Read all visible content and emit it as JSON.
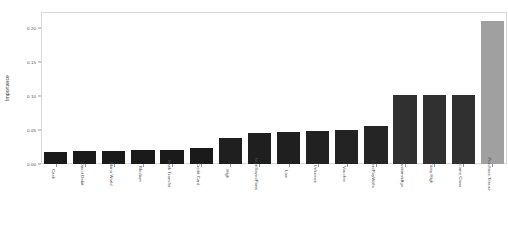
{
  "chart_data": {
    "type": "bar",
    "title": "",
    "subtitle": "",
    "xlabel": "",
    "ylabel": "Importance",
    "ylim": [
      0,
      0.2234
    ],
    "grid": false,
    "legend": null,
    "orientation": "vertical",
    "sorted": "ascending",
    "categories": [
      "Cash",
      "Direct Debit",
      "Mono World",
      "Medium",
      "Bank Transfer",
      "Credit Card",
      "High",
      "NumSavedParts",
      "Low",
      "Unknown",
      "Voucher",
      "CardPayWalls",
      "CustomerAge",
      "Very High",
      "Income Class",
      "Purchase Tenure"
    ],
    "values": [
      0.018,
      0.019,
      0.019,
      0.02,
      0.02,
      0.024,
      0.038,
      0.046,
      0.047,
      0.048,
      0.05,
      0.056,
      0.102,
      0.102,
      0.102,
      0.21
    ],
    "ytick_labels": [
      "0.00",
      "0.05",
      "0.10",
      "0.15",
      "0.20"
    ],
    "ytick_values": [
      0.0,
      0.05,
      0.1,
      0.15,
      0.2
    ],
    "bar_colors": [
      "#1a1a1a",
      "#1a1a1a",
      "#1a1a1a",
      "#1a1a1a",
      "#1a1a1a",
      "#1a1a1a",
      "#1f1f1f",
      "#1f1f1f",
      "#1f1f1f",
      "#212121",
      "#232323",
      "#252525",
      "#303030",
      "#303030",
      "#303030",
      "#a0a0a0"
    ],
    "highlight_color": "#a0a0a0",
    "base_color": "#1a1a1a"
  }
}
